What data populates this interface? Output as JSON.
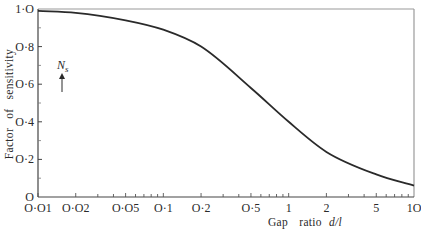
{
  "chart_data": {
    "type": "line",
    "title": "",
    "xlabel": "Gap ratio d/l",
    "ylabel": "Factor of sensitivity",
    "x_scale": "log",
    "xlim": [
      0.01,
      10
    ],
    "ylim": [
      0,
      1.0
    ],
    "grid": false,
    "x_ticks_major": [
      0.01,
      0.02,
      0.05,
      0.1,
      0.2,
      0.5,
      1,
      2,
      5,
      10
    ],
    "x_tick_labels": [
      "O·O1",
      "O·O2",
      "O·O5",
      "O·1",
      "O·2",
      "O·5",
      "1",
      "2",
      "5",
      "1O"
    ],
    "y_ticks": [
      0,
      0.2,
      0.4,
      0.6,
      0.8,
      1.0
    ],
    "y_tick_labels": [
      "O",
      "O·2",
      "O·4",
      "O·6",
      "O·8",
      "1·O"
    ],
    "series": [
      {
        "name": "Factor of sensitivity",
        "x": [
          0.01,
          0.02,
          0.05,
          0.1,
          0.2,
          0.5,
          1,
          2,
          5,
          10
        ],
        "values": [
          0.99,
          0.98,
          0.94,
          0.89,
          0.8,
          0.58,
          0.4,
          0.24,
          0.12,
          0.06
        ]
      }
    ],
    "annotations": [
      {
        "text": "N",
        "subscript": "s",
        "x": 0.015,
        "y": 0.74,
        "arrow": "up"
      }
    ]
  },
  "labels": {
    "ylabel_word1": "Factor",
    "ylabel_word2": "of",
    "ylabel_word3": "sensitivity",
    "xlabel_word1": "Gap",
    "xlabel_word2": "ratio",
    "xlabel_var": "d/l",
    "annotation_main": "N",
    "annotation_sub": "s"
  }
}
